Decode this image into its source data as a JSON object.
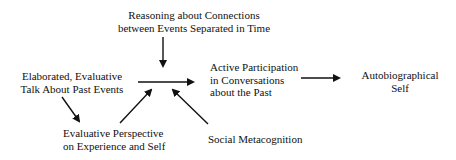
{
  "diagram": {
    "nodes": {
      "reasoning": {
        "lines": [
          "Reasoning about Connections",
          "between Events Separated in Time"
        ]
      },
      "elaborated": {
        "lines": [
          "Elaborated, Evaluative",
          "Talk About Past Events"
        ]
      },
      "active": {
        "lines": [
          "Active Participation",
          "in Conversations",
          "about the Past"
        ]
      },
      "autobiographical": {
        "lines": [
          "Autobiographical",
          "Self"
        ]
      },
      "evaluative": {
        "lines": [
          "Evaluative Perspective",
          "on Experience and Self"
        ]
      },
      "social": {
        "lines": [
          "Social Metacognition"
        ]
      }
    },
    "edges": [
      {
        "from": "reasoning",
        "to": "active"
      },
      {
        "from": "elaborated",
        "to": "active"
      },
      {
        "from": "elaborated",
        "to": "evaluative"
      },
      {
        "from": "evaluative",
        "to": "active"
      },
      {
        "from": "social",
        "to": "active"
      },
      {
        "from": "active",
        "to": "autobiographical"
      }
    ],
    "colors": {
      "stroke": "#111111",
      "background": "#ffffff"
    }
  }
}
